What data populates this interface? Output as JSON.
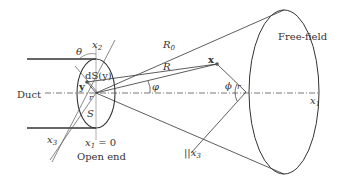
{
  "diagram": {
    "labels": {
      "duct": "Duct",
      "open_end": "Open end",
      "free_field": "Free-field",
      "x1_eq_0": "x",
      "x1_eq_0_sub": "1",
      "x1_eq_0_rest": " = 0",
      "x1_axis": "x",
      "x1_axis_sub": "1",
      "x2_axis": "x",
      "x2_axis_sub": "2",
      "x3_axis": "x",
      "x3_axis_sub": "3",
      "parallel_x3": "||x",
      "parallel_x3_sub": "3",
      "theta": "θ",
      "dS_y": "dS(y)",
      "y_vec": "y",
      "r": "r",
      "S": "S",
      "R0": "R",
      "R0_sub": "0",
      "R": "R",
      "phi_small": "φ",
      "phi_large": "ϕ",
      "phi_r": "r",
      "x_point": "x"
    },
    "colors": {
      "line": "#333333",
      "light_line": "#777777",
      "background": "#ffffff"
    }
  }
}
